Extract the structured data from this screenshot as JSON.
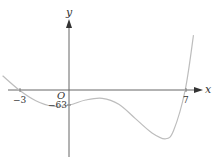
{
  "chart_data": {
    "type": "line",
    "title": "",
    "xlabel": "x",
    "ylabel": "y",
    "origin_label": "O",
    "x_ticks": [
      {
        "value": -3,
        "label": "−3"
      },
      {
        "value": 7,
        "label": "7"
      }
    ],
    "y_ticks": [
      {
        "value": -63,
        "label": "−63"
      }
    ],
    "grid": false,
    "legend": "none",
    "series": [
      {
        "name": "curve",
        "description": "quartic-like curve with x-intercepts at -3 and 7, y-intercept at -63",
        "x_intercepts": [
          -3,
          7
        ],
        "y_intercept": -63,
        "points": [
          {
            "x": -4.0,
            "y": 60
          },
          {
            "x": -3.0,
            "y": 0
          },
          {
            "x": -2.0,
            "y": -45
          },
          {
            "x": -1.0,
            "y": -68
          },
          {
            "x": 0.0,
            "y": -63
          },
          {
            "x": 1.0,
            "y": -42
          },
          {
            "x": 2.0,
            "y": -35
          },
          {
            "x": 3.0,
            "y": -60
          },
          {
            "x": 4.0,
            "y": -120
          },
          {
            "x": 5.0,
            "y": -180
          },
          {
            "x": 5.8,
            "y": -205
          },
          {
            "x": 6.3,
            "y": -170
          },
          {
            "x": 7.0,
            "y": 0
          },
          {
            "x": 7.5,
            "y": 230
          }
        ]
      }
    ]
  },
  "colors": {
    "axis": "#555555",
    "curve": "#bdbdbd",
    "text": "#333333"
  }
}
